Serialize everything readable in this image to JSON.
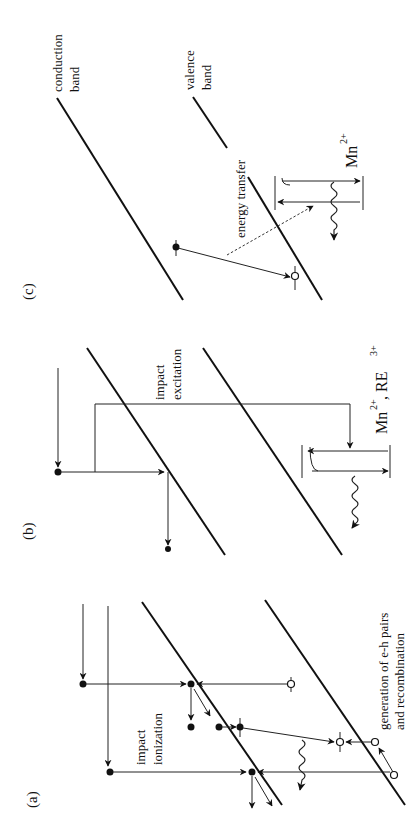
{
  "figure": {
    "orientation": "rotated 90 degrees counter-clockwise",
    "panels": [
      {
        "id": "a",
        "label": "(a)",
        "annotations": {
          "process": [
            "impact",
            "ionization"
          ],
          "secondary": [
            "generation of e-h pairs",
            "and recombination"
          ]
        }
      },
      {
        "id": "b",
        "label": "(b)",
        "annotations": {
          "process": [
            "impact",
            "excitation"
          ],
          "ion_base": "Mn",
          "ion_charge": "2+",
          "ion_sep": " , RE",
          "ion2_charge": "3+"
        }
      },
      {
        "id": "c",
        "label": "(c)",
        "annotations": {
          "conduction": [
            "conduction",
            "band"
          ],
          "valence": [
            "valence",
            "band"
          ],
          "transfer": "energy transfer",
          "ion_base": "Mn",
          "ion_charge": "2+"
        }
      }
    ],
    "legend_symbols": {
      "electron": "filled circle",
      "hole": "open circle",
      "emission": "wavy arrow"
    },
    "colors": {
      "ink": "#111111",
      "background": "#ffffff"
    }
  }
}
